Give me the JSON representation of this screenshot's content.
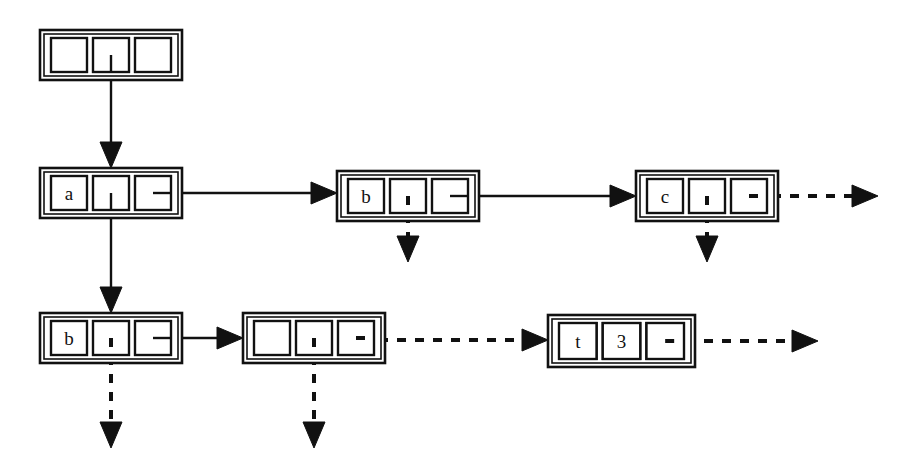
{
  "figure": {
    "type": "box-and-pointer-diagram",
    "background_color": "#ffffff",
    "ink_color": "#111111",
    "width": 914,
    "height": 472
  },
  "nodes": [
    {
      "id": "node-root",
      "row": 1,
      "x": 40,
      "y": 30,
      "w": 142,
      "h": 50,
      "cells": [
        {
          "label": "",
          "kind": "empty"
        },
        {
          "label": "",
          "kind": "pointer-down"
        },
        {
          "label": "",
          "kind": "empty"
        }
      ]
    },
    {
      "id": "node-a",
      "row": 2,
      "x": 40,
      "y": 168,
      "w": 142,
      "h": 50,
      "cells": [
        {
          "label": "a",
          "kind": "value"
        },
        {
          "label": "",
          "kind": "pointer-down"
        },
        {
          "label": "",
          "kind": "pointer-right"
        }
      ]
    },
    {
      "id": "node-b-row2",
      "row": 2,
      "x": 337,
      "y": 171,
      "w": 142,
      "h": 50,
      "cells": [
        {
          "label": "b",
          "kind": "value"
        },
        {
          "label": "",
          "kind": "pointer-down-dashed"
        },
        {
          "label": "",
          "kind": "pointer-right"
        }
      ]
    },
    {
      "id": "node-c",
      "row": 2,
      "x": 636,
      "y": 171,
      "w": 142,
      "h": 50,
      "cells": [
        {
          "label": "c",
          "kind": "value"
        },
        {
          "label": "",
          "kind": "pointer-down-dashed"
        },
        {
          "label": "",
          "kind": "pointer-right-dashed"
        }
      ]
    },
    {
      "id": "node-b-row3",
      "row": 3,
      "x": 40,
      "y": 313,
      "w": 142,
      "h": 50,
      "cells": [
        {
          "label": "b",
          "kind": "value"
        },
        {
          "label": "",
          "kind": "pointer-down-dashed"
        },
        {
          "label": "",
          "kind": "pointer-right"
        }
      ]
    },
    {
      "id": "node-empty-row3",
      "row": 3,
      "x": 243,
      "y": 313,
      "w": 142,
      "h": 50,
      "cells": [
        {
          "label": "",
          "kind": "empty"
        },
        {
          "label": "",
          "kind": "pointer-down-dashed"
        },
        {
          "label": "",
          "kind": "pointer-right-dashed"
        }
      ]
    },
    {
      "id": "node-t3",
      "row": 3,
      "x": 548,
      "y": 315,
      "w": 147,
      "h": 52,
      "cells": [
        {
          "label": "t",
          "kind": "value"
        },
        {
          "label": "3",
          "kind": "value"
        },
        {
          "label": "",
          "kind": "pointer-right-dashed"
        }
      ]
    }
  ],
  "edges": [
    {
      "id": "edge-root-to-a",
      "style": "solid",
      "orientation": "vertical",
      "from": "node-root",
      "to": "node-a",
      "x1": 111,
      "y1": 55,
      "x2": 111,
      "y2": 168
    },
    {
      "id": "edge-a-to-b-row3",
      "style": "solid",
      "orientation": "vertical",
      "from": "node-a",
      "to": "node-b-row3",
      "x1": 111,
      "y1": 193,
      "x2": 111,
      "y2": 313
    },
    {
      "id": "edge-a-to-b-row2",
      "style": "solid",
      "orientation": "horizontal",
      "from": "node-a",
      "to": "node-b-row2",
      "x1": 158,
      "y1": 193,
      "x2": 337,
      "y2": 193
    },
    {
      "id": "edge-b-to-c",
      "style": "solid",
      "orientation": "horizontal",
      "from": "node-b-row2",
      "to": "node-c",
      "x1": 455,
      "y1": 196,
      "x2": 636,
      "y2": 196
    },
    {
      "id": "edge-c-dangling-right",
      "style": "dashed",
      "orientation": "horizontal",
      "from": "node-c",
      "to": null,
      "x1": 754,
      "y1": 196,
      "x2": 878,
      "y2": 196
    },
    {
      "id": "edge-b-row2-down",
      "style": "dashed",
      "orientation": "vertical",
      "from": "node-b-row2",
      "to": null,
      "x1": 408,
      "y1": 196,
      "x2": 408,
      "y2": 262
    },
    {
      "id": "edge-c-down",
      "style": "dashed",
      "orientation": "vertical",
      "from": "node-c",
      "to": null,
      "x1": 707,
      "y1": 196,
      "x2": 707,
      "y2": 262
    },
    {
      "id": "edge-b-row3-to-empty",
      "style": "solid",
      "orientation": "horizontal",
      "from": "node-b-row3",
      "to": "node-empty-row3",
      "x1": 158,
      "y1": 338,
      "x2": 243,
      "y2": 338
    },
    {
      "id": "edge-empty-to-t3",
      "style": "dashed",
      "orientation": "horizontal",
      "from": "node-empty-row3",
      "to": "node-t3",
      "x1": 361,
      "y1": 340,
      "x2": 548,
      "y2": 340
    },
    {
      "id": "edge-t3-dangling-right",
      "style": "dashed",
      "orientation": "horizontal",
      "from": "node-t3",
      "to": null,
      "x1": 668,
      "y1": 341,
      "x2": 818,
      "y2": 341
    },
    {
      "id": "edge-b-row3-down",
      "style": "dashed",
      "orientation": "vertical",
      "from": "node-b-row3",
      "to": null,
      "x1": 111,
      "y1": 338,
      "x2": 111,
      "y2": 448
    },
    {
      "id": "edge-empty-row3-down",
      "style": "dashed",
      "orientation": "vertical",
      "from": "node-empty-row3",
      "to": null,
      "x1": 314,
      "y1": 338,
      "x2": 314,
      "y2": 448
    }
  ]
}
